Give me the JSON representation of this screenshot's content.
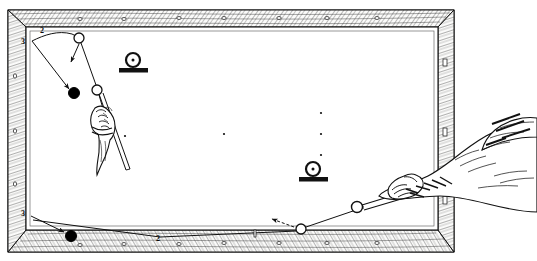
{
  "figure": {
    "type": "line-illustration",
    "canvas": {
      "width": 537,
      "height": 261
    },
    "colors": {
      "ink": "#111111",
      "cloth": "#ffffff",
      "rail_wood": "#f2f2f0",
      "hatch": "#555555",
      "ball_solid": "#000000",
      "ball_open_fill": "#ffffff"
    }
  },
  "table": {
    "name": "carom-billiards-table",
    "frame": {
      "outer": {
        "x": 6,
        "y": 8,
        "width": 450,
        "height": 246
      },
      "inner_cloth": {
        "x": 28,
        "y": 26,
        "width": 404,
        "height": 205
      },
      "texture": "diagonal-wood-hatching"
    },
    "rails": [
      {
        "name": "top-rail",
        "sight_marker_shape": "circle",
        "sight_count": 7
      },
      {
        "name": "bottom-rail",
        "sight_marker_shape": "circle",
        "sight_count": 7
      },
      {
        "name": "left-rail",
        "sight_marker_shape": "circle",
        "sight_count": 3
      },
      {
        "name": "right-rail",
        "sight_marker_shape": "rectangle",
        "sight_count": 3
      }
    ]
  },
  "labels": [
    {
      "id": "label-top-2",
      "text": "2",
      "x": 40,
      "y": 32
    },
    {
      "id": "label-left-3-upper",
      "text": "3",
      "x": 21,
      "y": 42
    },
    {
      "id": "label-left-3-lower",
      "text": "3",
      "x": 21,
      "y": 214
    },
    {
      "id": "label-bottom-2",
      "text": "2",
      "x": 158,
      "y": 239
    }
  ],
  "balls": [
    {
      "id": "ball-top-cue-white",
      "kind": "open",
      "cx": 79,
      "cy": 38,
      "r": 5.0
    },
    {
      "id": "ball-object-black-upper",
      "kind": "solid",
      "cx": 74,
      "cy": 93,
      "r": 5.5
    },
    {
      "id": "ball-white-mid-upper",
      "kind": "open",
      "cx": 97,
      "cy": 90,
      "r": 5.0
    },
    {
      "id": "ball-object-black-lower",
      "kind": "solid",
      "cx": 71,
      "cy": 236,
      "r": 5.5
    },
    {
      "id": "ball-white-bottom-rail",
      "kind": "open",
      "cx": 301,
      "cy": 229,
      "r": 5.0
    },
    {
      "id": "ball-cue-white-right",
      "kind": "open",
      "cx": 357,
      "cy": 207,
      "r": 5.5
    }
  ],
  "spots": [
    {
      "id": "spot-left",
      "cx": 125,
      "cy": 136
    },
    {
      "id": "spot-center",
      "cx": 224,
      "cy": 134
    },
    {
      "id": "spot-right-upper",
      "cx": 321,
      "cy": 113
    },
    {
      "id": "spot-right-mid",
      "cx": 321,
      "cy": 134
    },
    {
      "id": "spot-right-lower",
      "cx": 321,
      "cy": 155
    }
  ],
  "markers": [
    {
      "id": "stand-marker-upper",
      "label": "ball-on-stand",
      "cx": 133,
      "cy": 63
    },
    {
      "id": "stand-marker-lower",
      "label": "ball-on-stand",
      "cx": 313,
      "cy": 172
    }
  ],
  "hands": [
    {
      "id": "bridge-hand-left",
      "description": "bridge hand holding cue on table, upper-left"
    },
    {
      "id": "stroke-hand-right",
      "description": "arm and hand gripping cue butt, entering from right edge"
    }
  ],
  "cues": [
    {
      "id": "cue-upper-left",
      "description": "cue stick angled down-right through bridge hand"
    },
    {
      "id": "cue-right",
      "description": "cue stick aimed at cue ball from right side"
    }
  ],
  "trajectories": [
    {
      "id": "path-top-curve",
      "description": "curved path from left rail to top cue ball"
    },
    {
      "id": "path-to-black-upper",
      "description": "line from top ball down-left to black ball, arrowhead"
    },
    {
      "id": "path-short-arrow-upper",
      "description": "short arrow from top ball pointing down-left"
    },
    {
      "id": "path-top-to-white-mid",
      "description": "line from top ball down to white mid ball"
    },
    {
      "id": "path-bottom-long",
      "description": "long line across bottom of table to left, arrowhead at black ball"
    },
    {
      "id": "path-bottom-arrow",
      "description": "short arrow near bottom-rail ball pointing left"
    },
    {
      "id": "path-cue-to-ball",
      "description": "line from right cue ball to bottom-rail ball"
    }
  ]
}
